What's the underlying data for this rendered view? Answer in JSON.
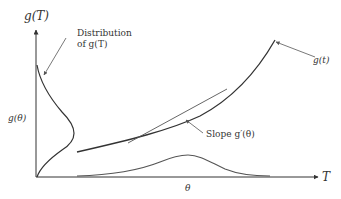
{
  "diagram": {
    "y_axis_label": "g(T)",
    "x_axis_label": "T",
    "distribution_label_line1": "Distribution",
    "distribution_label_line2": "of g(T)",
    "curve_label": "g(t)",
    "slope_label": "Slope g′(θ)",
    "y_tick_label": "g(θ)",
    "x_tick_label": "θ",
    "colors": {
      "axis": "#333333",
      "curve": "#333333",
      "density": "#555555",
      "arrow": "#555555"
    }
  }
}
